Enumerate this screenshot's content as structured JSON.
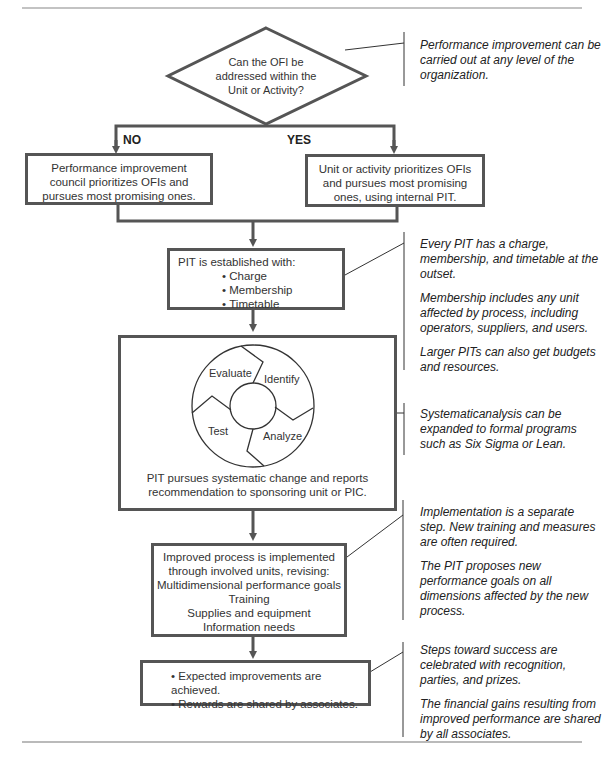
{
  "decision": {
    "question": "Can the OFI be addressed within the Unit or Activity?",
    "no_label": "NO",
    "yes_label": "YES"
  },
  "no_branch": {
    "text": "Performance improvement council prioritizes OFIs and pursues most promising ones."
  },
  "yes_branch": {
    "text": "Unit or activity prioritizes OFIs and pursues most promising ones, using internal PIT."
  },
  "pit_box": {
    "title": "PIT is established with:",
    "items": [
      "Charge",
      "Membership",
      "Timetable"
    ]
  },
  "cycle_box": {
    "stages": [
      "Evaluate",
      "Identify",
      "Analyze",
      "Test"
    ],
    "caption": "PIT pursues systematic change and reports recommendation to sponsoring unit or PIC."
  },
  "implement_box": {
    "lines": [
      "Improved process is implemented",
      "through involved units, revising:",
      "Multidimensional performance goals",
      "Training",
      "Supplies and equipment",
      "Information needs"
    ]
  },
  "result_box": {
    "items": [
      "Expected improvements are achieved.",
      "Rewards are shared by associates."
    ]
  },
  "notes": {
    "n1": [
      "Performance improvement can be carried out at any level of the organization."
    ],
    "n2": [
      "Every PIT has a charge, membership, and timetable at the outset.",
      "Membership includes any unit affected by process, including operators, suppliers, and users.",
      "Larger PITs can also get budgets and resources."
    ],
    "n3": [
      "Systematicanalysis can be expanded to formal programs such as Six Sigma or Lean."
    ],
    "n4": [
      "Implementation is a separate step. New training and measures are often required.",
      "The PIT proposes new performance goals on all dimensions affected by the new process."
    ],
    "n5": [
      "Steps toward success are celebrated with recognition, parties, and prizes.",
      "The financial gains resulting from improved performance are shared by all associates."
    ]
  },
  "colors": {
    "line": "#555555",
    "text": "#222222",
    "rule": "#777777"
  }
}
